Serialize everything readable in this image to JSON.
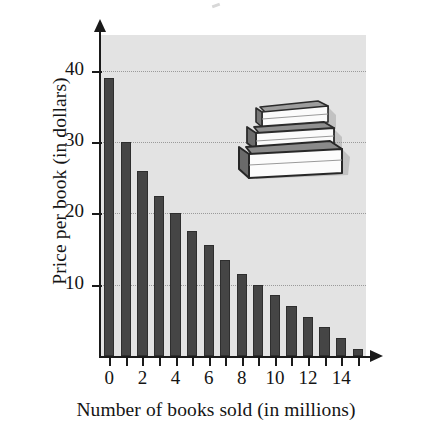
{
  "chart_data": {
    "type": "bar",
    "title": "",
    "xlabel": "Number of books sold (in millions)",
    "ylabel": "Price per book (in dollars)",
    "categories": [
      0,
      1,
      2,
      3,
      4,
      5,
      6,
      7,
      8,
      9,
      10,
      11,
      12,
      13,
      14,
      15
    ],
    "values": [
      39,
      30,
      26,
      22.5,
      20,
      17.5,
      15.5,
      13.5,
      11.5,
      10,
      8.5,
      7,
      5.5,
      4,
      2.5,
      1
    ],
    "x_tick_labels": [
      "0",
      "2",
      "4",
      "6",
      "8",
      "10",
      "12",
      "14"
    ],
    "x_tick_values": [
      0,
      2,
      4,
      6,
      8,
      10,
      12,
      14
    ],
    "y_tick_labels": [
      "10",
      "20",
      "30",
      "40"
    ],
    "y_tick_values": [
      10,
      20,
      30,
      40
    ],
    "xlim": [
      -0.5,
      15.5
    ],
    "ylim": [
      0,
      45
    ],
    "grid": true,
    "grid_axis": "y",
    "legend": null,
    "bar_color": "#454545",
    "plot_background": "#e3e3e3",
    "axis_color": "#1a1a1a",
    "gridline_color": "#9a9a9a"
  },
  "illustration": {
    "name": "stack-of-books",
    "description": "Stack of three books",
    "books": [
      {
        "position": "top",
        "label": "small-book"
      },
      {
        "position": "middle",
        "label": "medium-book"
      },
      {
        "position": "bottom",
        "label": "large-book"
      }
    ]
  }
}
